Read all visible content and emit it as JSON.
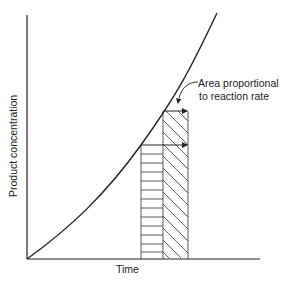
{
  "diagram": {
    "title": "",
    "y_axis_label": "Product concentration",
    "x_axis_label": "Time",
    "annotation": {
      "line1": "Area proportional",
      "line2": "to reaction rate"
    },
    "colors": {
      "ink": "#222222",
      "background": "#ffffff"
    }
  }
}
